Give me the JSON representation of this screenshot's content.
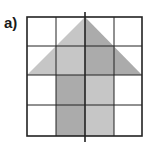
{
  "label": "a)",
  "grid": {
    "rows": 4,
    "cols": 4,
    "left": 27,
    "top": 17,
    "cell": 28.75,
    "line_color": "#222222",
    "outer_stroke": 1.6,
    "inner_stroke": 1
  },
  "symmetry_line": {
    "x": 85,
    "y1": 12,
    "y2": 142,
    "color": "#222222"
  },
  "shape": {
    "name": "arrow",
    "triangle_left_half": {
      "points": "27,75 85,17 85,75",
      "color": "#c6c6c6"
    },
    "triangle_right_half": {
      "points": "85,17 142,75 85,75",
      "color": "#ababab"
    },
    "stem_left_half": {
      "x": 56,
      "y": 75,
      "w": 29,
      "h": 61,
      "color": "#ababab"
    },
    "stem_right_half": {
      "x": 85,
      "y": 75,
      "w": 29,
      "h": 61,
      "color": "#c6c6c6"
    }
  },
  "colors": {
    "light_gray": "#c6c6c6",
    "dark_gray": "#ababab",
    "lines": "#222222"
  }
}
